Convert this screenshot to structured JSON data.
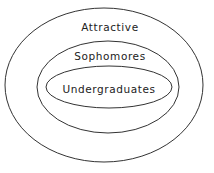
{
  "diagram": {
    "type": "euler",
    "stroke_color": "#333333",
    "background": "#ffffff",
    "sets": [
      {
        "id": "outer",
        "label": "Attractive",
        "cx": 104,
        "cy": 85,
        "rx": 99,
        "ry": 77,
        "label_y": 31
      },
      {
        "id": "middle",
        "label": "Sophomores",
        "cx": 108,
        "cy": 87,
        "rx": 71,
        "ry": 46,
        "label_y": 60
      },
      {
        "id": "inner",
        "label": "Undergraduates",
        "cx": 109,
        "cy": 87,
        "rx": 63,
        "ry": 21,
        "label_y": 93
      }
    ]
  }
}
